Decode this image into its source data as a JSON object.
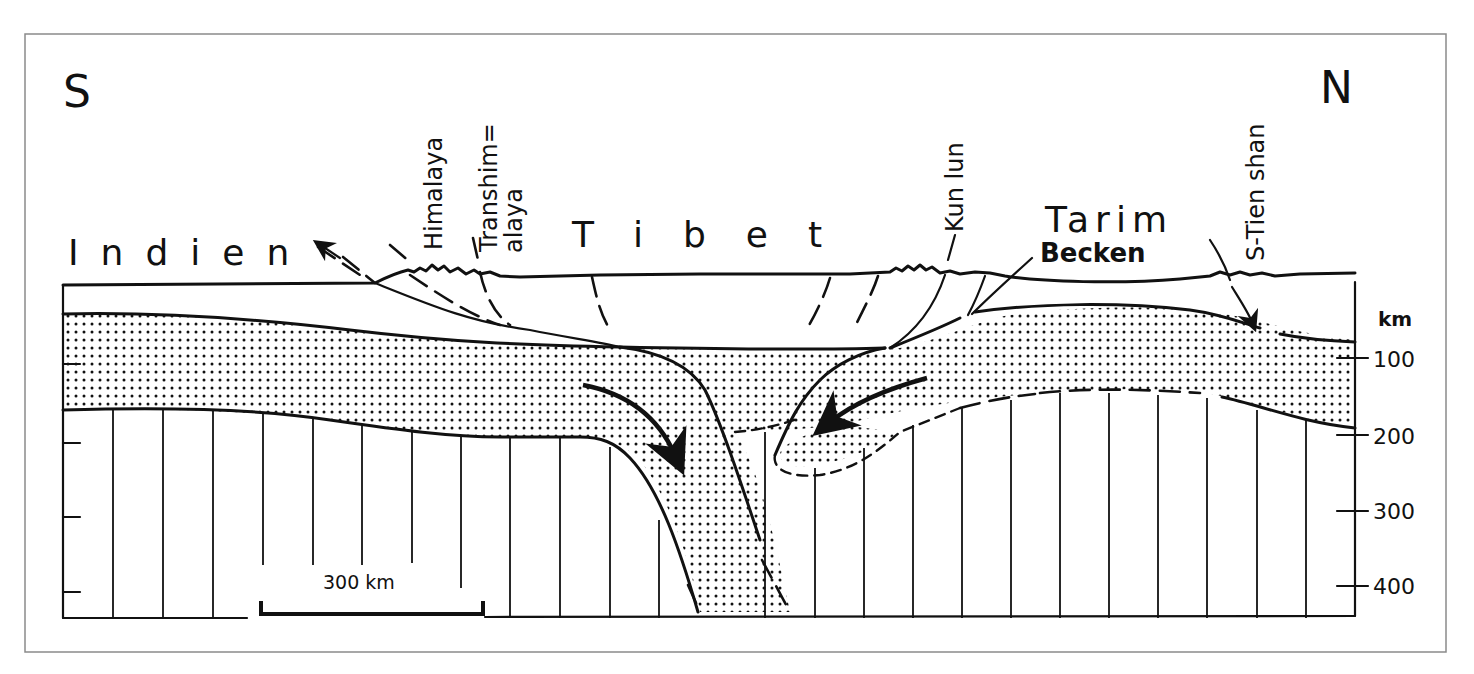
{
  "figure": {
    "orientation": {
      "left": "S",
      "right": "N"
    },
    "regions": {
      "india": "Indien",
      "tibet": "Tibet",
      "tarim": "Tarim",
      "tarim_sub": "Becken"
    },
    "ranges": {
      "himalaya": "Himalaya",
      "transhimalaya_1": "Transhim=",
      "transhimalaya_2": "alaya",
      "kunlun": "Kun lun",
      "tienshan": "S-Tien shan"
    },
    "depth_axis": {
      "unit": "km",
      "ticks": [
        "100",
        "200",
        "300",
        "400"
      ]
    },
    "scale_bar": {
      "label": "300 km"
    }
  },
  "style": {
    "ink": "#111111",
    "paper": "#ffffff",
    "frame": "#8a8a8a"
  }
}
